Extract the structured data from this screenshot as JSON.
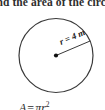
{
  "figure": {
    "type": "geometry-diagram",
    "shape": "circle",
    "prompt_text": "Find the area of the circle.",
    "prompt_clipped": true,
    "radius_label": "r = 4 m",
    "radius_value": 4,
    "radius_unit": "m",
    "center_marker": "dot",
    "formula": {
      "lhs": "A",
      "operator": "=",
      "rhs_base": "πr",
      "rhs_exponent": "2",
      "full": "A = πr²",
      "clipped": true
    },
    "colors": {
      "background": "#ffffff",
      "stroke": "#3a3a3a",
      "text": "#2e2e2e",
      "center_dot": "#101010"
    },
    "geometry": {
      "center_x": 56,
      "center_y": 55,
      "radius_px": 37,
      "radius_line_angle_deg": -23
    }
  }
}
